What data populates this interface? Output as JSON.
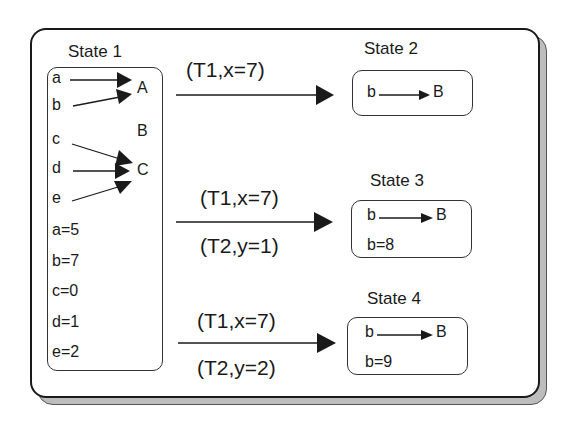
{
  "states": [
    {
      "title": "State 1",
      "sources": [
        "a",
        "b",
        "c",
        "d",
        "e"
      ],
      "targets": [
        "A",
        "B",
        "C"
      ],
      "mappings": [
        {
          "from": "a",
          "to": "A"
        },
        {
          "from": "b",
          "to": "A"
        },
        {
          "from": "c",
          "to": "C"
        },
        {
          "from": "d",
          "to": "C"
        },
        {
          "from": "e",
          "to": "C"
        }
      ],
      "values": [
        "a=5",
        "b=7",
        "c=0",
        "d=1",
        "e=2"
      ]
    },
    {
      "title": "State 2",
      "mapping": {
        "from": "b",
        "to": "B"
      },
      "values": []
    },
    {
      "title": "State 3",
      "mapping": {
        "from": "b",
        "to": "B"
      },
      "values": [
        "b=8"
      ]
    },
    {
      "title": "State 4",
      "mapping": {
        "from": "b",
        "to": "B"
      },
      "values": [
        "b=9"
      ]
    }
  ],
  "transitions": [
    {
      "to": "State 2",
      "top_label": "(T1,x=7)",
      "bottom_label": ""
    },
    {
      "to": "State 3",
      "top_label": "(T1,x=7)",
      "bottom_label": "(T2,y=1)"
    },
    {
      "to": "State 4",
      "top_label": "(T1,x=7)",
      "bottom_label": "(T2,y=2)"
    }
  ],
  "colors": {
    "line": "#1a1a1a",
    "shadow": "#bdbdbd",
    "background": "#ffffff"
  }
}
